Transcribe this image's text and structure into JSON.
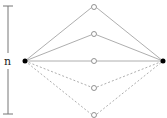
{
  "diagram": {
    "bracket_label": "n",
    "source_node": {
      "x": 25,
      "y": 61,
      "filled": true
    },
    "sink_node": {
      "x": 163,
      "y": 61,
      "filled": true
    },
    "middle_nodes": [
      {
        "x": 94,
        "y": 7,
        "style": "solid"
      },
      {
        "x": 94,
        "y": 34,
        "style": "solid"
      },
      {
        "x": 94,
        "y": 61,
        "style": "solid"
      },
      {
        "x": 94,
        "y": 88,
        "style": "dashed"
      },
      {
        "x": 94,
        "y": 115,
        "style": "dashed"
      }
    ],
    "colors": {
      "edge": "#999999",
      "node": "#000000",
      "bracket": "#777777"
    }
  }
}
